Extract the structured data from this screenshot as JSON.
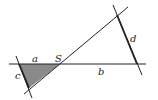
{
  "diagram": {
    "labels": {
      "a": "a",
      "b": "b",
      "c": "c",
      "d": "d",
      "S": "S"
    },
    "colors": {
      "line": "#222222",
      "fill": "#8a8a8a",
      "background": "#ffffff"
    }
  }
}
